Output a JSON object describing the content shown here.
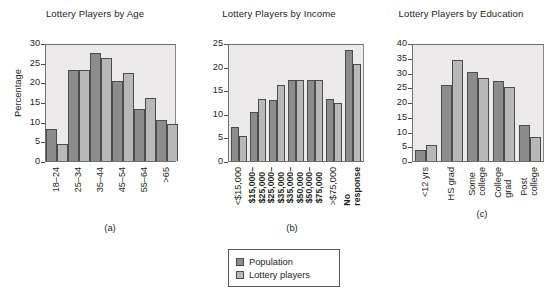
{
  "figure": {
    "subcaptions": {
      "a": "(a)",
      "b": "(b)",
      "c": "(c)"
    }
  },
  "legend": {
    "items": [
      {
        "label": "Population",
        "color": "#8d8c8c"
      },
      {
        "label": "Lottery players",
        "color": "#b9b8b8"
      }
    ]
  },
  "chart_data": [
    {
      "type": "bar",
      "title": "Lottery Players by Age",
      "xlabel": "",
      "ylabel": "Percentage",
      "ylim": [
        0,
        30
      ],
      "yticks": [
        0,
        5,
        10,
        15,
        20,
        25,
        30
      ],
      "grid": false,
      "legend_position": "below-figure",
      "categories": [
        "18–24",
        "25–34",
        "35–44",
        "45–54",
        "55–64",
        ">65"
      ],
      "series": [
        {
          "name": "Population",
          "values": [
            8.2,
            23.1,
            27.4,
            20.4,
            13.2,
            10.4
          ]
        },
        {
          "name": "Lottery players",
          "values": [
            4.2,
            23.1,
            26.3,
            22.5,
            16.1,
            9.4
          ]
        }
      ]
    },
    {
      "type": "bar",
      "title": "Lottery Players by Income",
      "xlabel": "",
      "ylabel": "",
      "ylim": [
        0,
        25
      ],
      "yticks": [
        0,
        5,
        10,
        15,
        20,
        25
      ],
      "grid": false,
      "legend_position": "below-figure",
      "categories": [
        "<$15,000",
        "$15,000–\n$25,000",
        "$25,000–\n$35,000",
        "$35,000–\n$50,000",
        "$50,000–\n$75,000",
        ">$75,000",
        "No\nresponse"
      ],
      "category_lines": [
        [
          "<$15,000"
        ],
        [
          "$15,000–",
          "$25,000"
        ],
        [
          "$25,000–",
          "$35,000"
        ],
        [
          "$35,000–",
          "$50,000"
        ],
        [
          "$50,000–",
          "$75,000"
        ],
        [
          ">$75,000"
        ],
        [
          "No",
          "response"
        ]
      ],
      "series": [
        {
          "name": "Population",
          "values": [
            7.2,
            10.3,
            13.0,
            17.2,
            17.2,
            13.1,
            23.5
          ]
        },
        {
          "name": "Lottery players",
          "values": [
            5.3,
            13.2,
            16.2,
            17.2,
            17.2,
            12.2,
            20.5
          ]
        }
      ]
    },
    {
      "type": "bar",
      "title": "Lottery Players by Education",
      "xlabel": "",
      "ylabel": "",
      "ylim": [
        0,
        40
      ],
      "yticks": [
        0,
        5,
        10,
        15,
        20,
        25,
        30,
        35,
        40
      ],
      "grid": false,
      "legend_position": "below-figure",
      "categories": [
        "<12 yrs",
        "HS grad",
        "Some\ncollege",
        "College\ngrad",
        "Post\ncollege"
      ],
      "category_lines": [
        [
          "<12 yrs"
        ],
        [
          "HS grad"
        ],
        [
          "Some",
          "college"
        ],
        [
          "College",
          "grad"
        ],
        [
          "Post",
          "college"
        ]
      ],
      "series": [
        {
          "name": "Population",
          "values": [
            3.9,
            25.8,
            30.1,
            27.2,
            12.2
          ]
        },
        {
          "name": "Lottery players",
          "values": [
            5.4,
            34.2,
            28.0,
            25.1,
            8.2
          ]
        }
      ]
    }
  ]
}
